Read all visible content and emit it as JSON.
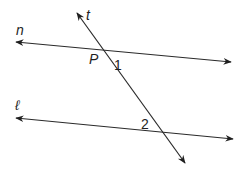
{
  "diagram": {
    "title": "",
    "colors": {
      "line": "#2a2a2a",
      "text": "#1f1f1f",
      "background": "#ffffff"
    },
    "lines": [
      {
        "name": "n",
        "label": "n",
        "from": [
          16,
          42
        ],
        "to": [
          231,
          62
        ],
        "arrows": "both"
      },
      {
        "name": "l",
        "label": "ℓ",
        "from": [
          16,
          118
        ],
        "to": [
          233,
          139
        ],
        "arrows": "both"
      },
      {
        "name": "t",
        "label": "t",
        "from": [
          77,
          13
        ],
        "to": [
          185,
          163
        ],
        "arrows": "both"
      }
    ],
    "labels": {
      "t": "t",
      "n": "n",
      "l": "ℓ",
      "point_p": "P",
      "angle_1": "1",
      "angle_2": "2"
    }
  }
}
